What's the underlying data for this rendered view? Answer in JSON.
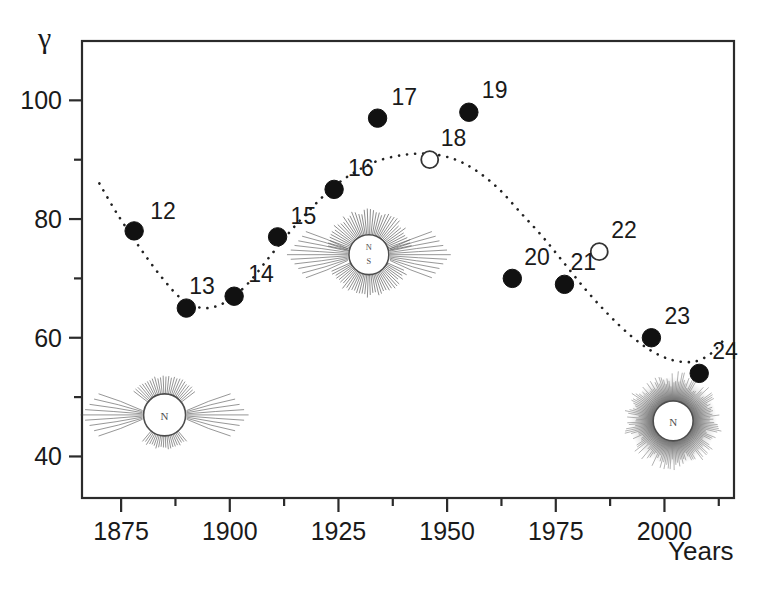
{
  "figure": {
    "y_axis_symbol": "γ",
    "x_axis_title": "Years"
  },
  "chart_data": {
    "type": "scatter",
    "title": "",
    "subtitle": "",
    "xlabel": "Years",
    "ylabel": "γ",
    "xlim": [
      1866,
      2016
    ],
    "ylim": [
      33,
      110
    ],
    "grid": false,
    "legend": "none",
    "x_ticks": [
      1875,
      1900,
      1925,
      1950,
      1975,
      2000
    ],
    "x_tick_labels": [
      "1875",
      "1900",
      "1925",
      "1950",
      "1975",
      "2000"
    ],
    "x_minor_ticks": [
      1887.5,
      1912.5,
      1937.5,
      1962.5,
      1987.5,
      2012.5
    ],
    "y_ticks": [
      40,
      60,
      80,
      100
    ],
    "y_tick_labels": [
      "40",
      "60",
      "80",
      "100"
    ],
    "y_minor_ticks": [
      50,
      70,
      90
    ],
    "series": [
      {
        "name": "Solar cycles (observed)",
        "marker": "filled-circle",
        "points": [
          {
            "label": "12",
            "x": 1878,
            "y": 78,
            "label_dx": 16,
            "label_dy": -12
          },
          {
            "label": "13",
            "x": 1890,
            "y": 65,
            "label_dx": 3,
            "label_dy": -14
          },
          {
            "label": "14",
            "x": 1901,
            "y": 67,
            "label_dx": 14,
            "label_dy": -14
          },
          {
            "label": "15",
            "x": 1911,
            "y": 77,
            "label_dx": 13,
            "label_dy": -13
          },
          {
            "label": "16",
            "x": 1924,
            "y": 85,
            "label_dx": 14,
            "label_dy": -13
          },
          {
            "label": "17",
            "x": 1934,
            "y": 97,
            "label_dx": 14,
            "label_dy": -13
          },
          {
            "label": "19",
            "x": 1955,
            "y": 98,
            "label_dx": 13,
            "label_dy": -14
          },
          {
            "label": "20",
            "x": 1965,
            "y": 70,
            "label_dx": 12,
            "label_dy": -13
          },
          {
            "label": "21",
            "x": 1977,
            "y": 69,
            "label_dx": 6,
            "label_dy": -14
          },
          {
            "label": "23",
            "x": 1997,
            "y": 60,
            "label_dx": 13,
            "label_dy": -14
          },
          {
            "label": "24",
            "x": 2008,
            "y": 54,
            "label_dx": 13,
            "label_dy": -14
          }
        ]
      },
      {
        "name": "Solar cycles (predicted)",
        "marker": "open-circle",
        "points": [
          {
            "label": "18",
            "x": 1946,
            "y": 90,
            "label_dx": 11,
            "label_dy": -14
          },
          {
            "label": "22",
            "x": 1985,
            "y": 74.5,
            "label_dx": 12,
            "label_dy": -14
          }
        ]
      }
    ],
    "trend_curve": {
      "name": "dotted fitted trend",
      "style": "dotted",
      "points": [
        {
          "x": 1870,
          "y": 86
        },
        {
          "x": 1874,
          "y": 81
        },
        {
          "x": 1879,
          "y": 75.5
        },
        {
          "x": 1884,
          "y": 70.5
        },
        {
          "x": 1889,
          "y": 66.5
        },
        {
          "x": 1894,
          "y": 65
        },
        {
          "x": 1899,
          "y": 66
        },
        {
          "x": 1904,
          "y": 69
        },
        {
          "x": 1909,
          "y": 73.5
        },
        {
          "x": 1914,
          "y": 78
        },
        {
          "x": 1919,
          "y": 82
        },
        {
          "x": 1924,
          "y": 85.5
        },
        {
          "x": 1929,
          "y": 88
        },
        {
          "x": 1934,
          "y": 89.8
        },
        {
          "x": 1940,
          "y": 90.8
        },
        {
          "x": 1946,
          "y": 91
        },
        {
          "x": 1952,
          "y": 90
        },
        {
          "x": 1957,
          "y": 88
        },
        {
          "x": 1962,
          "y": 85
        },
        {
          "x": 1967,
          "y": 81
        },
        {
          "x": 1972,
          "y": 77
        },
        {
          "x": 1977,
          "y": 72.5
        },
        {
          "x": 1982,
          "y": 68
        },
        {
          "x": 1987,
          "y": 64
        },
        {
          "x": 1992,
          "y": 60.5
        },
        {
          "x": 1997,
          "y": 57.8
        },
        {
          "x": 2002,
          "y": 56.2
        },
        {
          "x": 2007,
          "y": 56
        },
        {
          "x": 2011,
          "y": 57.5
        },
        {
          "x": 2014,
          "y": 60
        }
      ]
    },
    "inset_images": [
      {
        "name": "sun-diagram-solar-minimum-left",
        "x": 1885,
        "y": 47,
        "size": 1.0
      },
      {
        "name": "sun-diagram-solar-midcycle-center",
        "x": 1932,
        "y": 74,
        "size": 1.05
      },
      {
        "name": "sun-diagram-solar-maximum-right",
        "x": 2002,
        "y": 46,
        "size": 1.0
      }
    ]
  }
}
